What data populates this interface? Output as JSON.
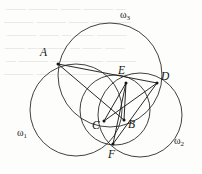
{
  "figure": {
    "type": "euclidean-geometry-figure",
    "stroke_color": "#2b2b2b",
    "label_color": "#141414",
    "background_color": "#fdfdfb",
    "width": 202,
    "height": 174
  },
  "circles": [
    {
      "id": "omega1",
      "label": "ω",
      "subscript": "1",
      "label_x": 17,
      "label_y": 128,
      "cx": 76,
      "cy": 110,
      "r": 46
    },
    {
      "id": "omega2",
      "label": "ω",
      "subscript": "2",
      "label_x": 174,
      "label_y": 136,
      "cx": 140,
      "cy": 115,
      "r": 42
    },
    {
      "id": "omega3",
      "label": "ω",
      "subscript": "3",
      "label_x": 120,
      "label_y": 10,
      "cx": 110,
      "cy": 75,
      "r": 52
    },
    {
      "id": "omega-small",
      "label": "",
      "subscript": "",
      "label_x": 0,
      "label_y": 0,
      "cx": 115,
      "cy": 110,
      "r": 35
    }
  ],
  "points": [
    {
      "id": "A",
      "label": "A",
      "x": 58,
      "y": 64,
      "label_x": 40,
      "label_y": 47
    },
    {
      "id": "E",
      "label": "E",
      "x": 126,
      "y": 83,
      "label_x": 118,
      "label_y": 65
    },
    {
      "id": "D",
      "label": "D",
      "x": 157,
      "y": 83,
      "label_x": 161,
      "label_y": 71
    },
    {
      "id": "C",
      "label": "C",
      "x": 104,
      "y": 121,
      "label_x": 92,
      "label_y": 120
    },
    {
      "id": "B",
      "label": "B",
      "x": 124,
      "y": 120,
      "label_x": 128,
      "label_y": 119
    },
    {
      "id": "F",
      "label": "F",
      "x": 113,
      "y": 144,
      "label_x": 108,
      "label_y": 149
    }
  ],
  "segments": [
    {
      "id": "AB",
      "from": "A",
      "to": "B",
      "x1": 58,
      "y1": 64,
      "x2": 124,
      "y2": 120
    },
    {
      "id": "AD",
      "from": "A",
      "to": "D",
      "x1": 58,
      "y1": 64,
      "x2": 157,
      "y2": 83
    },
    {
      "id": "EC",
      "from": "E",
      "to": "C",
      "x1": 126,
      "y1": 83,
      "x2": 104,
      "y2": 121
    },
    {
      "id": "EF",
      "from": "E",
      "to": "F",
      "x1": 126,
      "y1": 83,
      "x2": 113,
      "y2": 144
    },
    {
      "id": "DC",
      "from": "D",
      "to": "C",
      "x1": 157,
      "y1": 83,
      "x2": 104,
      "y2": 121
    },
    {
      "id": "DF",
      "from": "D",
      "to": "F",
      "x1": 157,
      "y1": 83,
      "x2": 113,
      "y2": 144
    },
    {
      "id": "EB",
      "from": "E",
      "to": "B",
      "x1": 126,
      "y1": 83,
      "x2": 124,
      "y2": 120
    }
  ],
  "background_bleed": {
    "lines": [
      "—— ——— —— ——— —",
      "———  ——— —— ————",
      "——— —— — —— ———",
      "—— ———— — —— ——",
      "— ——— ——— —— ———",
      "——— —— ———— — ——"
    ]
  }
}
